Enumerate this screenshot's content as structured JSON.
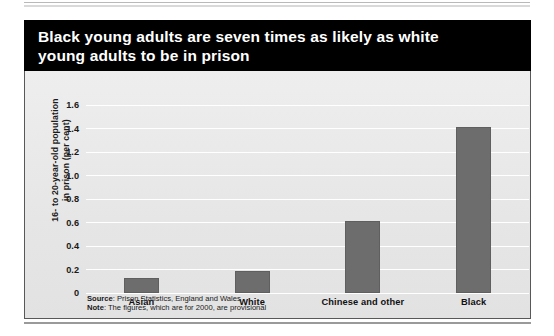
{
  "figure": {
    "title": "Black young adults are seven times as likely as white\nyoung adults to be in prison",
    "source_label": "Source",
    "source_text": ": Prison Statistics, England and Wales",
    "note_label": "Note",
    "note_text": ": The figures, which are for 2000, are provisional",
    "colors": {
      "banner_background": "#000000",
      "banner_text": "#ffffff",
      "panel_background": "#e9e9e9",
      "bar_fill": "#6d6d6d",
      "gridline": "#ffffff",
      "panel_border": "#585858"
    }
  },
  "chart_data": {
    "type": "bar",
    "title": "Black young adults are seven times as likely as white young adults to be in prison",
    "categories": [
      "Asian",
      "White",
      "Chinese and other",
      "Black"
    ],
    "values": [
      0.13,
      0.19,
      0.61,
      1.41
    ],
    "series": [
      {
        "name": "16- to 20-year-old population in prison (per cent)",
        "values": [
          0.13,
          0.19,
          0.61,
          1.41
        ]
      }
    ],
    "xlabel": "",
    "ylabel": "16- to 20-year-old population\nin prison (per cent)",
    "ylim": [
      0,
      1.6
    ],
    "ytick_labels": [
      "0",
      "0.2",
      "0.4",
      "0.6",
      "0.8",
      "1.0",
      "1.2",
      "1.4",
      "1.6"
    ],
    "ytick_values": [
      0,
      0.2,
      0.4,
      0.6,
      0.8,
      1.0,
      1.2,
      1.4,
      1.6
    ],
    "grid": true,
    "legend": "none",
    "source": "Prison Statistics, England and Wales",
    "note": "The figures, which are for 2000, are provisional"
  }
}
